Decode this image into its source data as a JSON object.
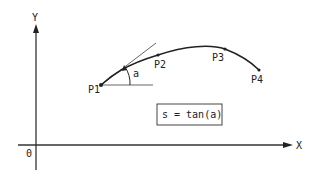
{
  "diagram": {
    "axes": {
      "x_label": "X",
      "y_label": "Y",
      "origin_label": "0"
    },
    "points": [
      {
        "label": "P1",
        "x": 101,
        "y": 85
      },
      {
        "label": "P2",
        "x": 158,
        "y": 55
      },
      {
        "label": "P3",
        "x": 225,
        "y": 49
      },
      {
        "label": "P4",
        "x": 259,
        "y": 70
      }
    ],
    "angle_label": "a",
    "formula": "s = tan(a)",
    "colors": {
      "line": "#222222",
      "tangent": "#555555",
      "background": "#ffffff"
    }
  }
}
